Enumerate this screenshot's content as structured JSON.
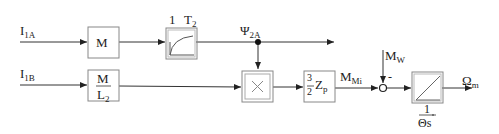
{
  "signals": {
    "input_a": {
      "main": "I",
      "sub": "1A"
    },
    "input_b": {
      "main": "I",
      "sub": "1B"
    },
    "flux": {
      "main": "Ψ",
      "sub": "2A"
    },
    "motor_torque": {
      "main": "M",
      "sub": "Mi"
    },
    "load_torque": {
      "main": "M",
      "sub": "W"
    },
    "output": {
      "main": "Ω",
      "sub": "m"
    }
  },
  "blocks": {
    "gain_m": {
      "label": "M"
    },
    "gain_m_l2": {
      "numerator": "M",
      "denominator_main": "L",
      "denominator_sub": "2"
    },
    "pt1": {
      "gain_label": "1",
      "time_const_main": "T",
      "time_const_sub": "2"
    },
    "multiplier": {
      "symbol": "×"
    },
    "torque_gain": {
      "num": "3",
      "den": "2",
      "var_main": "Z",
      "var_sub": "p"
    },
    "summing_junction": {
      "sign_load": "-"
    },
    "integrator": {
      "num": "1",
      "den": "Θs"
    }
  }
}
